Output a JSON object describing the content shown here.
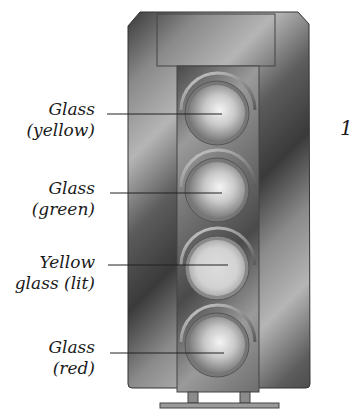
{
  "diagram": {
    "labels": [
      {
        "line1": "Glass",
        "line2": "(yellow)",
        "lamp_index": 0
      },
      {
        "line1": "Glass",
        "line2": "(green)",
        "lamp_index": 1
      },
      {
        "line1": "Yellow",
        "line2": "glass (lit)",
        "lamp_index": 2
      },
      {
        "line1": "Glass",
        "line2": "(red)",
        "lamp_index": 3
      }
    ],
    "edge_mark": "1",
    "colors": {
      "housing_dark": "#2b2b2b",
      "housing_light": "#a8a8a8",
      "lens_light": "#f2f2f2",
      "lens_dark": "#6e6e6e",
      "leader_line": "#222222"
    }
  }
}
